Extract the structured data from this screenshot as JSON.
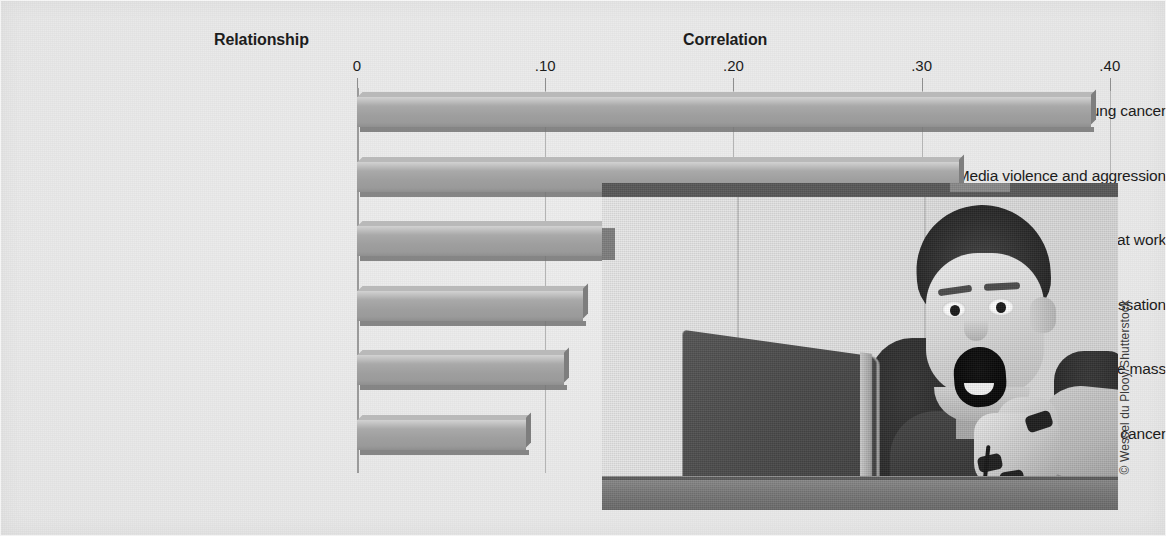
{
  "figure": {
    "width": 1166,
    "height": 536,
    "background_color": "#ebebeb"
  },
  "headers": {
    "relationship": "Relationship",
    "correlation": "Correlation"
  },
  "photo": {
    "alt": "Black-and-white photograph of a boy with an open mouth playing a video game in front of a laptop",
    "credit": "© Wessel du Plooy/Shutterstock"
  },
  "chart_data": {
    "type": "bar",
    "orientation": "horizontal",
    "title": "",
    "xlabel": "Correlation",
    "ylabel": "Relationship",
    "xlim": [
      0,
      0.4
    ],
    "grid": true,
    "legend": "none",
    "tick_labels": [
      "0",
      ".10",
      ".20",
      ".30",
      ".40"
    ],
    "tick_values": [
      0,
      0.1,
      0.2,
      0.3,
      0.4
    ],
    "categories": [
      "Smoking and lung cancer",
      "Media violence and aggression",
      "Passive smoking and lung cancer at work",
      "Nicotine patch and smoking cessation",
      "Calcium intake and bone mass",
      "Exposure to asbestos and laryngeal cancer"
    ],
    "values": [
      0.39,
      0.32,
      0.13,
      0.12,
      0.11,
      0.09
    ],
    "bar_color": "#a2a2a2",
    "bar_shadow_color": "#6f6f6f"
  }
}
